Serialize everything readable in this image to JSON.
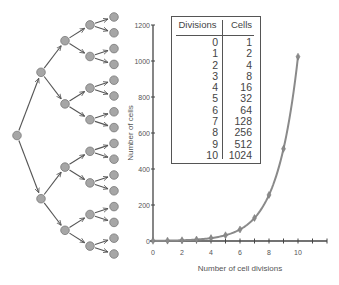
{
  "table": {
    "headers": [
      "Divisions",
      "Cells"
    ],
    "rows": [
      [
        "0",
        "1"
      ],
      [
        "1",
        "2"
      ],
      [
        "2",
        "4"
      ],
      [
        "3",
        "8"
      ],
      [
        "4",
        "16"
      ],
      [
        "5",
        "32"
      ],
      [
        "6",
        "64"
      ],
      [
        "7",
        "128"
      ],
      [
        "8",
        "256"
      ],
      [
        "9",
        "512"
      ],
      [
        "10",
        "1024"
      ]
    ]
  },
  "tree": {
    "levels": 5,
    "node_color": "#a6a6a6",
    "node_stroke": "#7a7a7a",
    "edge_color": "#555555"
  },
  "chart": {
    "xlabel": "Number of cell divisions",
    "ylabel": "Number of cells",
    "x_ticks": [
      "0",
      "2",
      "4",
      "6",
      "8",
      "10"
    ],
    "y_ticks": [
      "0",
      "200",
      "400",
      "600",
      "800",
      "1000",
      "1200"
    ],
    "line_color": "#8a8a8a"
  },
  "chart_data": {
    "type": "line",
    "title": "",
    "xlabel": "Number of cell divisions",
    "ylabel": "Number of cells",
    "x": [
      0,
      1,
      2,
      3,
      4,
      5,
      6,
      7,
      8,
      9,
      10
    ],
    "series": [
      {
        "name": "Cells",
        "values": [
          1,
          2,
          4,
          8,
          16,
          32,
          64,
          128,
          256,
          512,
          1024
        ]
      }
    ],
    "xlim": [
      0,
      12
    ],
    "ylim": [
      0,
      1200
    ],
    "x_ticks": [
      0,
      2,
      4,
      6,
      8,
      10
    ],
    "y_ticks": [
      0,
      200,
      400,
      600,
      800,
      1000,
      1200
    ],
    "grid": false,
    "legend": "none",
    "inset_table": {
      "headers": [
        "Divisions",
        "Cells"
      ],
      "rows": [
        [
          0,
          1
        ],
        [
          1,
          2
        ],
        [
          2,
          4
        ],
        [
          3,
          8
        ],
        [
          4,
          16
        ],
        [
          5,
          32
        ],
        [
          6,
          64
        ],
        [
          7,
          128
        ],
        [
          8,
          256
        ],
        [
          9,
          512
        ],
        [
          10,
          1024
        ]
      ]
    }
  }
}
